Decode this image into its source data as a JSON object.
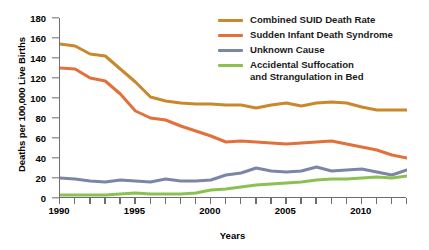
{
  "chart_data": {
    "type": "line",
    "title": "",
    "xlabel": "Years",
    "ylabel": "Deaths per 100,000 Live Births",
    "xlim": [
      1990,
      2013
    ],
    "ylim": [
      0,
      180
    ],
    "ytick_step": 20,
    "grid": false,
    "legend_position": "top-right-inside",
    "x": [
      1990,
      1991,
      1992,
      1993,
      1994,
      1995,
      1996,
      1997,
      1998,
      1999,
      2000,
      2001,
      2002,
      2003,
      2004,
      2005,
      2006,
      2007,
      2008,
      2009,
      2010,
      2011,
      2012,
      2013
    ],
    "xticklabels": [
      "1990",
      "1995",
      "2000",
      "2005",
      "2010"
    ],
    "xtickvalues": [
      1990,
      1995,
      2000,
      2005,
      2010
    ],
    "yticklabels": [
      "0",
      "20",
      "40",
      "60",
      "80",
      "100",
      "120",
      "140",
      "160",
      "180"
    ],
    "ytickvalues": [
      0,
      20,
      40,
      60,
      80,
      100,
      120,
      140,
      160,
      180
    ],
    "series": [
      {
        "name": "Combined SUID Death Rate",
        "color": "#C8882B",
        "values": [
          154,
          152,
          144,
          142,
          129,
          116,
          101,
          97,
          95,
          94,
          94,
          93,
          93,
          90,
          93,
          95,
          92,
          95,
          96,
          95,
          91,
          88,
          88,
          88
        ]
      },
      {
        "name": "Sudden Infant Death Syndrome",
        "color": "#E2703A",
        "values": [
          130,
          129,
          120,
          117,
          104,
          87,
          80,
          78,
          72,
          67,
          62,
          56,
          57,
          56,
          55,
          54,
          55,
          56,
          57,
          54,
          51,
          48,
          43,
          40
        ]
      },
      {
        "name": "Unknown Cause",
        "color": "#7C85A8",
        "values": [
          20,
          19,
          17,
          16,
          18,
          17,
          16,
          19,
          17,
          17,
          18,
          23,
          25,
          30,
          27,
          26,
          27,
          31,
          27,
          28,
          29,
          26,
          23,
          28
        ]
      },
      {
        "name": "Accidental Suffocation and Strangulation in Bed",
        "color": "#8CC152",
        "values": [
          3,
          3,
          3,
          3,
          4,
          5,
          4,
          4,
          4,
          5,
          8,
          9,
          11,
          13,
          14,
          15,
          16,
          18,
          19,
          19,
          20,
          21,
          20,
          22
        ]
      }
    ]
  },
  "legend": {
    "items": [
      {
        "label": "Combined SUID Death Rate",
        "color": "#C8882B"
      },
      {
        "label": "Sudden Infant Death Syndrome",
        "color": "#E2703A"
      },
      {
        "label": "Unknown Cause",
        "color": "#7C85A8"
      },
      {
        "label": "Accidental Suffocation\nand Strangulation in Bed",
        "color": "#8CC152"
      }
    ]
  }
}
